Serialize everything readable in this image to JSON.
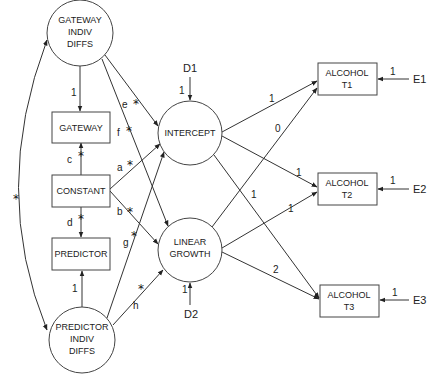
{
  "diagram": {
    "type": "structural-equation-model",
    "nodes": {
      "gateway_indiv": {
        "lines": [
          "GATEWAY",
          "INDIV",
          "DIFFS"
        ],
        "shape": "circle"
      },
      "gateway": {
        "lines": [
          "GATEWAY"
        ],
        "shape": "box"
      },
      "constant": {
        "lines": [
          "CONSTANT"
        ],
        "shape": "box"
      },
      "predictor": {
        "lines": [
          "PREDICTOR"
        ],
        "shape": "box"
      },
      "predictor_indiv": {
        "lines": [
          "PREDICTOR",
          "INDIV",
          "DIFFS"
        ],
        "shape": "circle"
      },
      "intercept": {
        "lines": [
          "INTERCEPT"
        ],
        "shape": "circle"
      },
      "growth": {
        "lines": [
          "LINEAR",
          "GROWTH"
        ],
        "shape": "circle"
      },
      "alc1": {
        "lines": [
          "ALCOHOL",
          "T1"
        ],
        "shape": "box"
      },
      "alc2": {
        "lines": [
          "ALCOHOL",
          "T2"
        ],
        "shape": "box"
      },
      "alc3": {
        "lines": [
          "ALCOHOL",
          "T3"
        ],
        "shape": "box"
      }
    },
    "disturbances": {
      "d1": "D1",
      "d2": "D2"
    },
    "errors": {
      "e1": "E1",
      "e2": "E2",
      "e3": "E3"
    },
    "path_labels": {
      "a": "a",
      "b": "b",
      "c": "c",
      "d": "d",
      "e": "e",
      "f": "f",
      "g": "g",
      "h": "h",
      "star": "*"
    },
    "fixed_loadings": {
      "gateway_indiv_to_gateway": "1",
      "predictor_indiv_to_predictor": "1",
      "d1_to_intercept": "1",
      "d2_to_growth": "1",
      "intercept_to_t1": "1",
      "intercept_to_t2": "1",
      "intercept_to_t3": "1",
      "growth_to_t1": "0",
      "growth_to_t2": "1",
      "growth_to_t3": "2",
      "e1_to_t1": "1",
      "e2_to_t2": "1",
      "e3_to_t3": "1"
    }
  }
}
